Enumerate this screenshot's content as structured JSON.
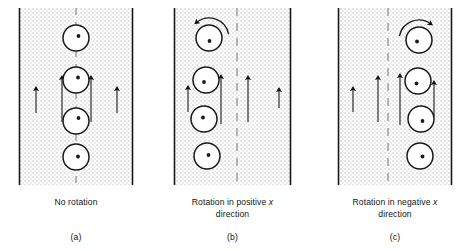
{
  "figure": {
    "background_color": "#ffffff",
    "texture_color": "#e2e2e2",
    "line_color": "#1a1a1a",
    "dash_color": "#8a8a8a",
    "panels": [
      {
        "id": "a",
        "letter": "(a)",
        "caption_lines": [
          "No rotation"
        ],
        "caption_italic_token": "",
        "channel": {
          "x": 19,
          "y": 8,
          "width": 114,
          "height": 177
        },
        "centerline_x": 76,
        "circle_radius": 13,
        "circles": [
          {
            "cx": 76,
            "cy": 38,
            "dot_dx": 2.5,
            "dot_dy": -2.0
          },
          {
            "cx": 76,
            "cy": 80,
            "dot_dx": 2.0,
            "dot_dy": -2.5
          },
          {
            "cx": 76,
            "cy": 121,
            "dot_dx": 2.5,
            "dot_dy": -3.0
          },
          {
            "cx": 76,
            "cy": 157,
            "dot_dx": 2.0,
            "dot_dy": -0.5
          }
        ],
        "arrows": [
          {
            "x": 36,
            "y_bottom": 113,
            "y_top": 89,
            "name": "velocity-arrow-outer-left"
          },
          {
            "x": 62,
            "y_bottom": 122,
            "y_top": 78,
            "name": "velocity-arrow-inner-left"
          },
          {
            "x": 91,
            "y_bottom": 122,
            "y_top": 78,
            "name": "velocity-arrow-inner-right"
          },
          {
            "x": 117,
            "y_bottom": 113,
            "y_top": 89,
            "name": "velocity-arrow-outer-right"
          }
        ],
        "rotation_arc": null
      },
      {
        "id": "b",
        "letter": "(b)",
        "caption_lines": [
          "Rotation in positive x",
          "direction"
        ],
        "caption_italic_token": "x",
        "channel": {
          "x": 174,
          "y": 8,
          "width": 117,
          "height": 177
        },
        "centerline_x": 237,
        "circle_radius": 13,
        "circles": [
          {
            "cx": 209,
            "cy": 38,
            "dot_dx": 0.5,
            "dot_dy": 3.0
          },
          {
            "cx": 206,
            "cy": 80,
            "dot_dx": -2.0,
            "dot_dy": 2.0
          },
          {
            "cx": 204,
            "cy": 119,
            "dot_dx": -1.0,
            "dot_dy": -1.5
          },
          {
            "cx": 207,
            "cy": 156,
            "dot_dx": 1.5,
            "dot_dy": -1.0
          }
        ],
        "arrows": [
          {
            "x": 188,
            "y_bottom": 112,
            "y_top": 88,
            "name": "velocity-arrow-1"
          },
          {
            "x": 221,
            "y_bottom": 124,
            "y_top": 77,
            "name": "velocity-arrow-2"
          },
          {
            "x": 248,
            "y_bottom": 122,
            "y_top": 78,
            "name": "velocity-arrow-3"
          },
          {
            "x": 279,
            "y_bottom": 108,
            "y_top": 90,
            "name": "velocity-arrow-4"
          }
        ],
        "rotation_arc": {
          "cx": 209,
          "cy": 38,
          "r": 20,
          "direction": "counterclockwise"
        }
      },
      {
        "id": "c",
        "letter": "(c)",
        "caption_lines": [
          "Rotation in negative x",
          "direction"
        ],
        "caption_italic_token": "x",
        "channel": {
          "x": 338,
          "y": 8,
          "width": 114,
          "height": 177
        },
        "centerline_x": 388,
        "circle_radius": 13,
        "circles": [
          {
            "cx": 419,
            "cy": 40,
            "dot_dx": -2.0,
            "dot_dy": 1.5
          },
          {
            "cx": 418,
            "cy": 81,
            "dot_dx": -1.5,
            "dot_dy": 2.5
          },
          {
            "cx": 421,
            "cy": 119,
            "dot_dx": 1.5,
            "dot_dy": 2.0
          },
          {
            "cx": 420,
            "cy": 156,
            "dot_dx": 2.5,
            "dot_dy": 0.5
          }
        ],
        "arrows": [
          {
            "x": 353,
            "y_bottom": 112,
            "y_top": 89,
            "name": "velocity-arrow-1"
          },
          {
            "x": 378,
            "y_bottom": 122,
            "y_top": 78,
            "name": "velocity-arrow-2"
          },
          {
            "x": 400,
            "y_bottom": 125,
            "y_top": 76,
            "name": "velocity-arrow-3"
          },
          {
            "x": 434,
            "y_bottom": 117,
            "y_top": 83,
            "name": "velocity-arrow-4"
          }
        ],
        "rotation_arc": {
          "cx": 419,
          "cy": 40,
          "r": 20,
          "direction": "clockwise"
        }
      }
    ]
  }
}
